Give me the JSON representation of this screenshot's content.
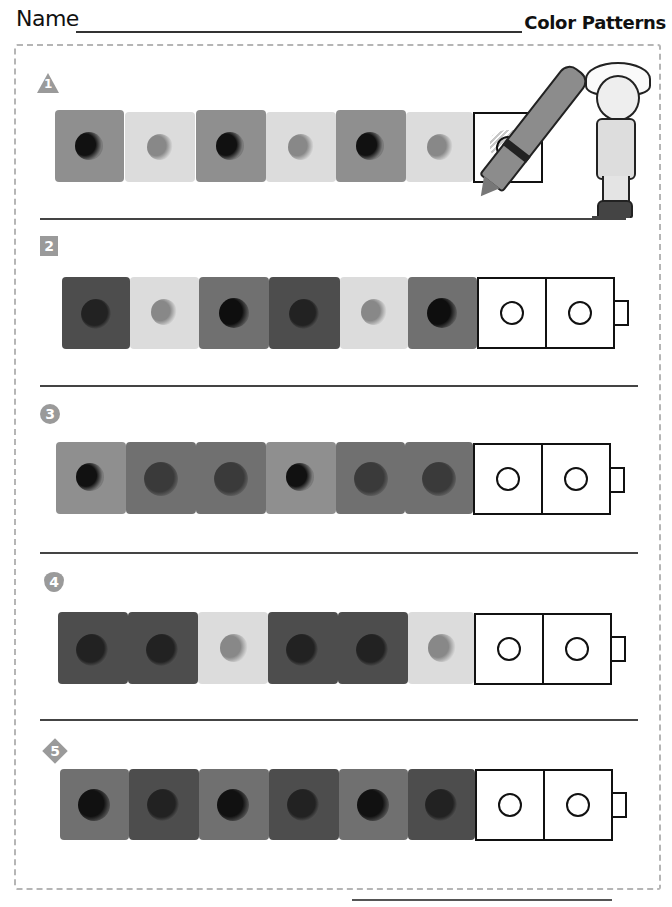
{
  "header": {
    "name_label": "Name",
    "title": "Color Patterns"
  },
  "colors": {
    "light": "#dcdcdc",
    "medium": "#8f8f8f",
    "medium_dark": "#707070",
    "dark": "#4d4d4d",
    "label_gray": "#9a9a9a"
  },
  "rows": [
    {
      "label": "1",
      "label_shape": "triangle",
      "cubes": [
        "medium",
        "light",
        "medium",
        "light",
        "medium",
        "light"
      ],
      "answer_boxes": 1,
      "example": true
    },
    {
      "label": "2",
      "label_shape": "square",
      "cubes": [
        "dark",
        "light",
        "medium_dark",
        "dark",
        "light",
        "medium_dark"
      ],
      "answer_boxes": 2,
      "example": false
    },
    {
      "label": "3",
      "label_shape": "circle",
      "cubes": [
        "medium",
        "medium_dark",
        "medium_dark",
        "medium",
        "medium_dark",
        "medium_dark"
      ],
      "answer_boxes": 2,
      "example": false
    },
    {
      "label": "4",
      "label_shape": "heart",
      "cubes": [
        "dark",
        "dark",
        "light",
        "dark",
        "dark",
        "light"
      ],
      "answer_boxes": 2,
      "example": false
    },
    {
      "label": "5",
      "label_shape": "diamond",
      "cubes": [
        "medium_dark",
        "dark",
        "medium_dark",
        "dark",
        "medium_dark",
        "dark"
      ],
      "answer_boxes": 2,
      "example": false
    }
  ]
}
